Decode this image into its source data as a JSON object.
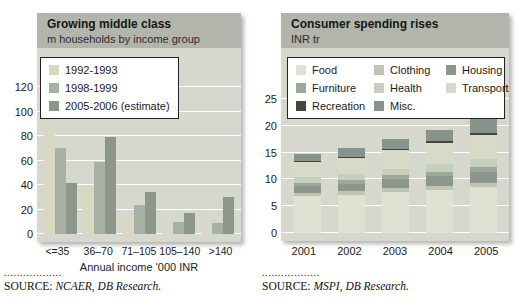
{
  "page": {
    "background": "#ffffff"
  },
  "colors": {
    "panel_bg": "#d6d8cd",
    "header_bg": "#b2b5ab",
    "gridline": "#ffffff",
    "text": "#1b1b1b"
  },
  "chart_data": [
    {
      "type": "bar",
      "stacked": false,
      "title": "Growing middle class",
      "subtitle": "m households by income group",
      "categories": [
        "<=35",
        "36–70",
        "71–105",
        "105–140",
        ">140"
      ],
      "series": [
        {
          "name": "1992-1993",
          "color": "#d7d9c0",
          "values": [
            91,
            39,
            15,
            4,
            2
          ]
        },
        {
          "name": "1998-1999",
          "color": "#a7b0a2",
          "values": [
            70,
            59,
            24,
            10,
            9
          ]
        },
        {
          "name": "2005-2006 (estimate)",
          "color": "#8c968b",
          "values": [
            42,
            79,
            34,
            17,
            30
          ]
        }
      ],
      "xlabel": "Annual income '000 INR",
      "ylabel": "",
      "yticks": [
        0,
        20,
        40,
        60,
        80,
        100,
        120
      ],
      "ylim": [
        0,
        152
      ],
      "grid": true,
      "legend_position": "top-left",
      "source": {
        "dots": "..................",
        "prefix": "SOURCE: ",
        "body": "NCAER, DB Research."
      }
    },
    {
      "type": "bar",
      "stacked": true,
      "title": "Consumer spending rises",
      "subtitle": "INR tr",
      "categories": [
        "2001",
        "2002",
        "2003",
        "2004",
        "2005"
      ],
      "series": [
        {
          "name": "Food",
          "color": "#e0e1d2",
          "values": [
            6.9,
            7.1,
            7.7,
            8.0,
            8.5
          ]
        },
        {
          "name": "Clothing",
          "color": "#bec5b3",
          "values": [
            0.6,
            0.65,
            0.7,
            0.8,
            0.9
          ]
        },
        {
          "name": "Housing",
          "color": "#8c968b",
          "values": [
            1.3,
            1.45,
            1.6,
            1.8,
            2.0
          ]
        },
        {
          "name": "Furniture",
          "color": "#9ea79b",
          "values": [
            0.6,
            0.65,
            0.75,
            0.85,
            0.95
          ]
        },
        {
          "name": "Health",
          "color": "#c8cebe",
          "values": [
            1.0,
            1.1,
            1.2,
            1.35,
            1.5
          ]
        },
        {
          "name": "Transport",
          "color": "#d7dac8",
          "values": [
            2.9,
            3.1,
            3.5,
            4.0,
            4.5
          ]
        },
        {
          "name": "Recreation",
          "color": "#40463e",
          "values": [
            0.2,
            0.2,
            0.25,
            0.3,
            0.35
          ]
        },
        {
          "name": "Misc.",
          "color": "#88938b",
          "values": [
            1.3,
            1.55,
            1.9,
            2.1,
            2.5
          ]
        }
      ],
      "totals": [
        14.8,
        15.8,
        17.6,
        19.2,
        21.2
      ],
      "xlabel": "",
      "ylabel": "",
      "yticks": [
        0,
        5,
        10,
        15,
        20,
        25
      ],
      "ylim": [
        0,
        34.5
      ],
      "grid": true,
      "legend_position": "top",
      "source": {
        "dots": "..................",
        "prefix": "SOURCE: ",
        "body": "MSPI, DB Research."
      }
    }
  ]
}
